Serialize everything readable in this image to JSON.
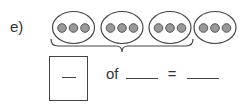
{
  "problem": {
    "label": "e)",
    "groups": [
      {
        "dots": 3,
        "bracketed": true
      },
      {
        "dots": 3,
        "bracketed": true
      },
      {
        "dots": 3,
        "bracketed": true
      },
      {
        "dots": 3,
        "bracketed": false
      }
    ],
    "dot_color": "#999999",
    "outline_color": "#444444",
    "equation": {
      "of_label": "of",
      "equals_label": "="
    }
  }
}
